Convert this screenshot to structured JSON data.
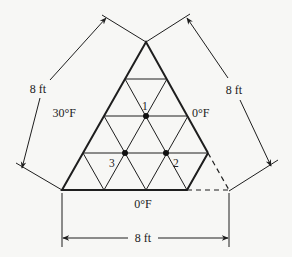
{
  "diagram": {
    "type": "triangular-finite-difference-mesh",
    "colors": {
      "ink": "#1e1e1e",
      "background": "#f7f7f5"
    },
    "dimensions": {
      "left": "8 ft",
      "right": "8 ft",
      "bottom": "8 ft"
    },
    "boundary_temperatures": {
      "left_edge": "30°F",
      "right_edge": "0°F",
      "bottom_edge": "0°F"
    },
    "nodes": [
      {
        "id": "1",
        "label": "1"
      },
      {
        "id": "2",
        "label": "2"
      },
      {
        "id": "3",
        "label": "3"
      }
    ],
    "mesh": {
      "rows": 4
    }
  }
}
